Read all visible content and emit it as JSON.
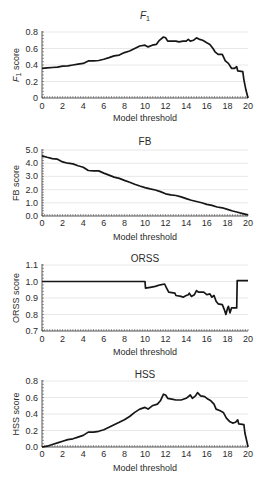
{
  "chart_data": [
    {
      "id": "f1",
      "type": "line",
      "title": "F1",
      "title_main": "F",
      "title_sub": "1",
      "xlabel": "Model threshold",
      "ylabel": "F1 score",
      "ylabel_main": "F",
      "ylabel_sub": "1",
      "ylabel_rest": " score",
      "xlim": [
        0,
        20
      ],
      "ylim": [
        0,
        0.8
      ],
      "xticks": [
        0,
        2,
        4,
        6,
        8,
        10,
        12,
        14,
        16,
        18,
        20
      ],
      "xtick_labels": [
        "0",
        "2",
        "4",
        "6",
        "8",
        "10",
        "12",
        "14",
        "16",
        "18",
        "20"
      ],
      "yticks": [
        0,
        0.2,
        0.4,
        0.6,
        0.8
      ],
      "ytick_labels": [
        "0",
        "0.2",
        "0.4",
        "0.6",
        "0.8"
      ],
      "grid": true,
      "legend": null,
      "series": [
        {
          "name": "F1 score",
          "points": [
            [
              0,
              0.36
            ],
            [
              0.5,
              0.365
            ],
            [
              1,
              0.37
            ],
            [
              1.5,
              0.375
            ],
            [
              2,
              0.385
            ],
            [
              2.5,
              0.39
            ],
            [
              3,
              0.4
            ],
            [
              3.5,
              0.41
            ],
            [
              4,
              0.42
            ],
            [
              4.5,
              0.45
            ],
            [
              5,
              0.45
            ],
            [
              5.5,
              0.455
            ],
            [
              6,
              0.47
            ],
            [
              6.5,
              0.49
            ],
            [
              7,
              0.51
            ],
            [
              7.5,
              0.52
            ],
            [
              8,
              0.55
            ],
            [
              8.5,
              0.57
            ],
            [
              9,
              0.6
            ],
            [
              9.5,
              0.63
            ],
            [
              10,
              0.64
            ],
            [
              10.3,
              0.62
            ],
            [
              10.7,
              0.64
            ],
            [
              11.1,
              0.65
            ],
            [
              11.4,
              0.7
            ],
            [
              11.8,
              0.74
            ],
            [
              12,
              0.73
            ],
            [
              12.2,
              0.69
            ],
            [
              12.6,
              0.69
            ],
            [
              13,
              0.69
            ],
            [
              13.3,
              0.68
            ],
            [
              13.7,
              0.69
            ],
            [
              14,
              0.69
            ],
            [
              14.2,
              0.71
            ],
            [
              14.4,
              0.69
            ],
            [
              14.7,
              0.7
            ],
            [
              15,
              0.73
            ],
            [
              15.3,
              0.71
            ],
            [
              15.6,
              0.7
            ],
            [
              16,
              0.67
            ],
            [
              16.3,
              0.65
            ],
            [
              16.6,
              0.6
            ],
            [
              16.8,
              0.56
            ],
            [
              17.1,
              0.53
            ],
            [
              17.5,
              0.53
            ],
            [
              17.8,
              0.45
            ],
            [
              18.1,
              0.42
            ],
            [
              18.4,
              0.36
            ],
            [
              18.7,
              0.36
            ],
            [
              18.9,
              0.38
            ],
            [
              19.0,
              0.33
            ],
            [
              19.5,
              0.32
            ],
            [
              19.6,
              0.22
            ],
            [
              19.8,
              0.1
            ],
            [
              20,
              0.0
            ]
          ]
        }
      ]
    },
    {
      "id": "fb",
      "type": "line",
      "title": "FB",
      "xlabel": "Model threshold",
      "ylabel": "FB score",
      "xlim": [
        0,
        20
      ],
      "ylim": [
        0,
        5.0
      ],
      "xticks": [
        0,
        2,
        4,
        6,
        8,
        10,
        12,
        14,
        16,
        18,
        20
      ],
      "xtick_labels": [
        "0",
        "2",
        "4",
        "6",
        "8",
        "10",
        "12",
        "14",
        "16",
        "18",
        "20"
      ],
      "yticks": [
        0,
        1,
        2,
        3,
        4,
        5
      ],
      "ytick_labels": [
        "0.0",
        "1.0",
        "2.0",
        "3.0",
        "4.0",
        "5.0"
      ],
      "grid": true,
      "legend": null,
      "series": [
        {
          "name": "FB score",
          "points": [
            [
              0,
              4.55
            ],
            [
              0.5,
              4.45
            ],
            [
              1,
              4.35
            ],
            [
              1.5,
              4.3
            ],
            [
              2,
              4.1
            ],
            [
              2.5,
              4.0
            ],
            [
              3,
              3.95
            ],
            [
              3.5,
              3.8
            ],
            [
              4,
              3.7
            ],
            [
              4.5,
              3.45
            ],
            [
              5,
              3.42
            ],
            [
              5.5,
              3.42
            ],
            [
              6,
              3.25
            ],
            [
              6.5,
              3.1
            ],
            [
              7,
              2.95
            ],
            [
              7.5,
              2.85
            ],
            [
              8,
              2.7
            ],
            [
              8.5,
              2.55
            ],
            [
              9,
              2.4
            ],
            [
              9.5,
              2.27
            ],
            [
              10,
              2.15
            ],
            [
              10.5,
              2.05
            ],
            [
              11,
              1.97
            ],
            [
              11.5,
              1.85
            ],
            [
              12,
              1.68
            ],
            [
              12.5,
              1.6
            ],
            [
              13,
              1.55
            ],
            [
              13.5,
              1.45
            ],
            [
              14,
              1.32
            ],
            [
              14.5,
              1.2
            ],
            [
              15,
              1.1
            ],
            [
              15.5,
              1.0
            ],
            [
              16,
              0.88
            ],
            [
              16.5,
              0.8
            ],
            [
              17,
              0.68
            ],
            [
              17.5,
              0.62
            ],
            [
              18,
              0.5
            ],
            [
              18.5,
              0.38
            ],
            [
              19,
              0.28
            ],
            [
              19.5,
              0.18
            ],
            [
              20,
              0.08
            ]
          ]
        }
      ]
    },
    {
      "id": "orss",
      "type": "line",
      "title": "ORSS",
      "xlabel": "Model threshold",
      "ylabel": "ORSS score",
      "xlim": [
        0,
        20
      ],
      "ylim": [
        0.7,
        1.1
      ],
      "xticks": [
        0,
        2,
        4,
        6,
        8,
        10,
        12,
        14,
        16,
        18,
        20
      ],
      "xtick_labels": [
        "0",
        "2",
        "4",
        "6",
        "8",
        "10",
        "12",
        "14",
        "16",
        "18",
        "20"
      ],
      "yticks": [
        0.7,
        0.8,
        0.9,
        1.0,
        1.1
      ],
      "ytick_labels": [
        "0.7",
        "0.8",
        "0.9",
        "1.0",
        "1.1"
      ],
      "grid": true,
      "legend": null,
      "series": [
        {
          "name": "ORSS score",
          "points": [
            [
              0,
              1.0
            ],
            [
              10,
              1.0
            ],
            [
              10.05,
              0.96
            ],
            [
              10.5,
              0.965
            ],
            [
              11,
              0.97
            ],
            [
              11.5,
              0.98
            ],
            [
              11.9,
              0.985
            ],
            [
              12.1,
              0.96
            ],
            [
              12.3,
              0.935
            ],
            [
              12.9,
              0.93
            ],
            [
              13.0,
              0.915
            ],
            [
              13.5,
              0.91
            ],
            [
              13.7,
              0.905
            ],
            [
              14,
              0.915
            ],
            [
              14.2,
              0.92
            ],
            [
              14.3,
              0.93
            ],
            [
              14.5,
              0.91
            ],
            [
              14.8,
              0.92
            ],
            [
              15.0,
              0.945
            ],
            [
              15.2,
              0.935
            ],
            [
              15.7,
              0.935
            ],
            [
              16,
              0.92
            ],
            [
              16.3,
              0.925
            ],
            [
              16.5,
              0.905
            ],
            [
              16.7,
              0.915
            ],
            [
              16.9,
              0.88
            ],
            [
              17.1,
              0.865
            ],
            [
              17.5,
              0.86
            ],
            [
              17.7,
              0.83
            ],
            [
              17.85,
              0.8
            ],
            [
              18.0,
              0.835
            ],
            [
              18.1,
              0.85
            ],
            [
              18.25,
              0.81
            ],
            [
              18.4,
              0.84
            ],
            [
              18.9,
              0.84
            ],
            [
              18.95,
              1.005
            ],
            [
              20,
              1.005
            ]
          ]
        }
      ]
    },
    {
      "id": "hss",
      "type": "line",
      "title": "HSS",
      "xlabel": "Model threshold",
      "ylabel": "HSS score",
      "xlim": [
        0,
        20
      ],
      "ylim": [
        0,
        0.8
      ],
      "xticks": [
        0,
        2,
        4,
        6,
        8,
        10,
        12,
        14,
        16,
        18,
        20
      ],
      "xtick_labels": [
        "0",
        "2",
        "4",
        "6",
        "8",
        "10",
        "12",
        "14",
        "16",
        "18",
        "20"
      ],
      "yticks": [
        0,
        0.2,
        0.4,
        0.6,
        0.8
      ],
      "ytick_labels": [
        "0.0",
        "0.2",
        "0.4",
        "0.6",
        "0.8"
      ],
      "grid": true,
      "legend": null,
      "series": [
        {
          "name": "HSS score",
          "points": [
            [
              0,
              0.0
            ],
            [
              0.5,
              0.01
            ],
            [
              1,
              0.03
            ],
            [
              1.5,
              0.05
            ],
            [
              2,
              0.07
            ],
            [
              2.5,
              0.09
            ],
            [
              3,
              0.1
            ],
            [
              3.5,
              0.12
            ],
            [
              4,
              0.14
            ],
            [
              4.5,
              0.18
            ],
            [
              5,
              0.18
            ],
            [
              5.5,
              0.19
            ],
            [
              6,
              0.21
            ],
            [
              6.5,
              0.24
            ],
            [
              7,
              0.27
            ],
            [
              7.5,
              0.3
            ],
            [
              8,
              0.33
            ],
            [
              8.5,
              0.37
            ],
            [
              9,
              0.42
            ],
            [
              9.5,
              0.46
            ],
            [
              10,
              0.48
            ],
            [
              10.3,
              0.46
            ],
            [
              10.7,
              0.5
            ],
            [
              11.2,
              0.52
            ],
            [
              11.5,
              0.56
            ],
            [
              11.8,
              0.64
            ],
            [
              12.0,
              0.63
            ],
            [
              12.2,
              0.59
            ],
            [
              12.6,
              0.58
            ],
            [
              13,
              0.57
            ],
            [
              13.5,
              0.57
            ],
            [
              14,
              0.59
            ],
            [
              14.4,
              0.63
            ],
            [
              14.6,
              0.59
            ],
            [
              14.9,
              0.62
            ],
            [
              15.1,
              0.66
            ],
            [
              15.4,
              0.62
            ],
            [
              15.8,
              0.61
            ],
            [
              16.1,
              0.58
            ],
            [
              16.4,
              0.56
            ],
            [
              16.7,
              0.52
            ],
            [
              16.9,
              0.46
            ],
            [
              17.3,
              0.44
            ],
            [
              17.6,
              0.42
            ],
            [
              17.9,
              0.35
            ],
            [
              18.2,
              0.31
            ],
            [
              18.5,
              0.29
            ],
            [
              18.8,
              0.3
            ],
            [
              19.0,
              0.33
            ],
            [
              19.1,
              0.28
            ],
            [
              19.6,
              0.27
            ],
            [
              19.7,
              0.17
            ],
            [
              19.9,
              0.06
            ],
            [
              20,
              0.0
            ]
          ]
        }
      ]
    }
  ]
}
